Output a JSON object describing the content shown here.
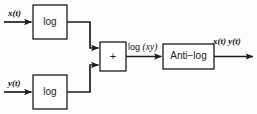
{
  "diagram": {
    "width": 257,
    "height": 114,
    "stroke_color": "#1d1d1d",
    "box_fill": "#ffffff",
    "background": "#fdfdfd"
  },
  "blocks": [
    {
      "id": "log_top",
      "label": "log",
      "x": 33,
      "y": 5,
      "w": 34,
      "h": 34
    },
    {
      "id": "log_bot",
      "label": "log",
      "x": 33,
      "y": 75,
      "w": 34,
      "h": 34
    },
    {
      "id": "summer",
      "label": "+",
      "x": 100,
      "y": 42,
      "w": 26,
      "h": 29
    },
    {
      "id": "antilog",
      "label": "Anti−log",
      "x": 163,
      "y": 44,
      "w": 51,
      "h": 25
    }
  ],
  "signals": {
    "input_top": "x(t)",
    "input_bottom": "y(t)",
    "intermediate": {
      "upright": "log",
      "italic": "(xy)"
    },
    "output": "x(t) y(t)"
  },
  "connections": [
    {
      "from": "input-x",
      "to": "log_top",
      "kind": "arrow"
    },
    {
      "from": "input-y",
      "to": "log_bot",
      "kind": "arrow"
    },
    {
      "from": "log_top",
      "to": "summer",
      "kind": "arrow-stepped-down"
    },
    {
      "from": "log_bot",
      "to": "summer",
      "kind": "arrow-stepped-up"
    },
    {
      "from": "summer",
      "to": "antilog",
      "kind": "arrow"
    },
    {
      "from": "antilog",
      "to": "output",
      "kind": "arrow"
    }
  ]
}
